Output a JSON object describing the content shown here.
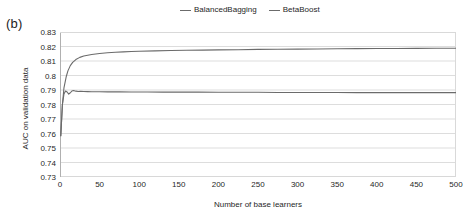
{
  "panel": {
    "label": "(b)"
  },
  "legend": {
    "position": "top-center",
    "entries": [
      {
        "name": "BalancedBagging",
        "color": "#6b6b6b"
      },
      {
        "name": "BetaBoost",
        "color": "#6b6b6b"
      }
    ]
  },
  "chart_data": {
    "type": "line",
    "title": "",
    "xlabel": "Number of base learners",
    "ylabel": "AUC on validation data",
    "xlim": [
      0,
      500
    ],
    "ylim": [
      0.73,
      0.83
    ],
    "xticks": [
      0,
      50,
      100,
      150,
      200,
      250,
      300,
      350,
      400,
      450,
      500
    ],
    "yticks": [
      "0.73",
      "0.74",
      "0.75",
      "0.76",
      "0.77",
      "0.78",
      "0.79",
      "0.8",
      "0.81",
      "0.82",
      "0.83"
    ],
    "grid": "horizontal",
    "legend_position": "top-center",
    "series": [
      {
        "name": "BalancedBagging",
        "color": "#6b6b6b",
        "x": [
          1,
          3,
          5,
          8,
          10,
          13,
          16,
          20,
          25,
          30,
          35,
          40,
          50,
          60,
          70,
          80,
          90,
          100,
          120,
          140,
          160,
          180,
          200,
          225,
          250,
          275,
          300,
          325,
          350,
          375,
          400,
          425,
          450,
          475,
          500
        ],
        "y": [
          0.7585,
          0.7795,
          0.7915,
          0.7995,
          0.8032,
          0.8068,
          0.809,
          0.811,
          0.8125,
          0.8134,
          0.814,
          0.8145,
          0.8152,
          0.8157,
          0.816,
          0.8163,
          0.8165,
          0.8167,
          0.817,
          0.8172,
          0.8174,
          0.8175,
          0.8177,
          0.8178,
          0.818,
          0.8181,
          0.8182,
          0.8183,
          0.8184,
          0.8185,
          0.8186,
          0.8186,
          0.8187,
          0.8188,
          0.8188
        ]
      },
      {
        "name": "BetaBoost",
        "color": "#6b6b6b",
        "x": [
          1,
          3,
          5,
          7,
          9,
          11,
          13,
          15,
          17,
          20,
          23,
          26,
          30,
          35,
          40,
          50,
          60,
          75,
          90,
          110,
          130,
          150,
          175,
          200,
          225,
          250,
          275,
          300,
          325,
          350,
          375,
          400,
          425,
          450,
          475,
          500
        ],
        "y": [
          0.7585,
          0.78,
          0.7872,
          0.7893,
          0.7886,
          0.7872,
          0.7881,
          0.7893,
          0.7896,
          0.7892,
          0.789,
          0.7891,
          0.789,
          0.7889,
          0.7888,
          0.7888,
          0.7887,
          0.7887,
          0.7886,
          0.7886,
          0.7885,
          0.7885,
          0.7885,
          0.7884,
          0.7884,
          0.7884,
          0.7883,
          0.7883,
          0.7883,
          0.7883,
          0.7882,
          0.7882,
          0.7882,
          0.7882,
          0.7882,
          0.7882
        ]
      }
    ]
  },
  "style": {
    "grid_color": "#d9d9d9",
    "axis_color": "#b0b0b0",
    "text_color": "#1f1f1f",
    "background": "#ffffff"
  }
}
